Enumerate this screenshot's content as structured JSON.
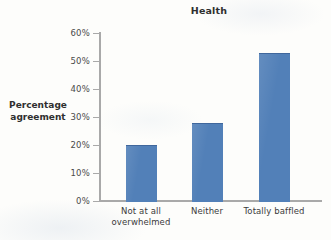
{
  "chart_data": {
    "type": "bar",
    "title": "Health",
    "xlabel": "",
    "ylabel": "Percentage agreement",
    "categories": [
      "Not at all overwhelmed",
      "Neither",
      "Totally baffled"
    ],
    "values": [
      20,
      28,
      53
    ],
    "ylim": [
      0,
      60
    ],
    "ytick_values": [
      0,
      10,
      20,
      30,
      40,
      50,
      60
    ],
    "ytick_labels": [
      "0%",
      "10%",
      "20%",
      "30%",
      "40%",
      "50%",
      "60%"
    ],
    "grid": false,
    "legend": null,
    "series": [
      {
        "name": "Percentage agreement",
        "values": [
          20,
          28,
          53
        ]
      }
    ],
    "bar_color": "#5280b8",
    "axis_color": "#a9a9a9"
  },
  "title": {
    "text": "Health"
  },
  "y_axis": {
    "title_line1": "Percentage",
    "title_line2": "agreement",
    "ticks": [
      {
        "label": "60%",
        "value": 60
      },
      {
        "label": "50%",
        "value": 50
      },
      {
        "label": "40%",
        "value": 40
      },
      {
        "label": "30%",
        "value": 30
      },
      {
        "label": "20%",
        "value": 20
      },
      {
        "label": "10%",
        "value": 10
      },
      {
        "label": "0%",
        "value": 0
      }
    ]
  },
  "x_axis": {
    "labels": [
      {
        "line1": "Not at all",
        "line2": "overwhelmed"
      },
      {
        "line1": "Neither",
        "line2": ""
      },
      {
        "line1": "Totally baffled",
        "line2": ""
      }
    ]
  },
  "bars": [
    {
      "category": "Not at all overwhelmed",
      "value": 20
    },
    {
      "category": "Neither",
      "value": 28
    },
    {
      "category": "Totally baffled",
      "value": 53
    }
  ],
  "artifacts": {
    "cut_text": ""
  }
}
